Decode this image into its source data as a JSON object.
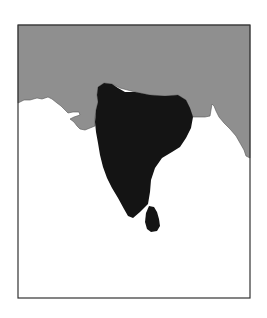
{
  "map": {
    "subject": "Indian subcontinent",
    "highlighted_regions": [
      "India",
      "Sri Lanka"
    ],
    "colors": {
      "background": "#ffffff",
      "land_context": "#8f8f8f",
      "highlight": "#141414",
      "frame": "#333333",
      "sea": "#ffffff"
    },
    "frame": {
      "x": 18,
      "y": 25,
      "width": 232,
      "height": 273
    }
  }
}
